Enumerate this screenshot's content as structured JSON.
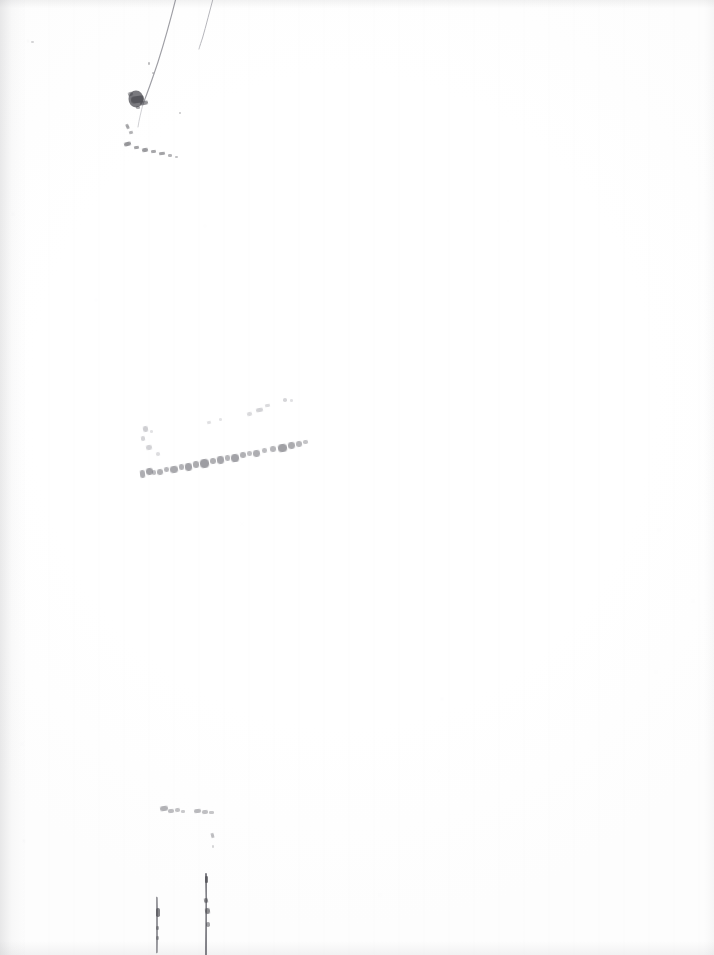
{
  "document": {
    "kind": "scanned-page",
    "page_label": "",
    "legible_text": "",
    "condition_note": "",
    "width_px": 714,
    "height_px": 955
  },
  "colors": {
    "paper": "#ffffff",
    "paper_tint": "#fdfdfd",
    "gutter_shadow": "#78787d",
    "ink_dark": "#4a4a4f",
    "ink_mid": "#7c7c82",
    "ink_faint": "#aeaeb4",
    "ink_ghost": "#d2d2d7"
  },
  "marks": {
    "top_strokes": [
      {
        "name": "diagonal-stroke-long",
        "path": "M176.5,-4 C172,14 165,40 158,62 C152,80 147,94 143,104",
        "width": 1.15,
        "color": "#8e8e95",
        "opacity": 0.85
      },
      {
        "name": "diagonal-stroke-short",
        "path": "M213.5,-3 C210,10 206,26 202.5,38 C200.5,44 199.5,47 199,49",
        "width": 1.0,
        "color": "#a3a3aa",
        "opacity": 0.8
      },
      {
        "name": "diagonal-stroke-tail",
        "path": "M143,104 C141,112 139,120 138,127",
        "width": 0.9,
        "color": "#b4b4ba",
        "opacity": 0.7
      }
    ],
    "top_blot": {
      "name": "ink-blot",
      "cx": 136,
      "cy": 99,
      "rx": 7.5,
      "ry": 8.5,
      "color": "#56565c",
      "opacity": 0.78
    },
    "top_fragments": [
      {
        "x": 128,
        "y": 92,
        "w": 5,
        "h": 4,
        "rot": -18,
        "op": 0.55
      },
      {
        "x": 131,
        "y": 96,
        "w": 13,
        "h": 7,
        "rot": -8,
        "op": 0.72
      },
      {
        "x": 140,
        "y": 101,
        "w": 8,
        "h": 4,
        "rot": -12,
        "op": 0.6
      },
      {
        "x": 136,
        "y": 106,
        "w": 4,
        "h": 3,
        "rot": 0,
        "op": 0.45
      },
      {
        "x": 126,
        "y": 124,
        "w": 3,
        "h": 5,
        "rot": -24,
        "op": 0.5
      },
      {
        "x": 129,
        "y": 131,
        "w": 4,
        "h": 3,
        "rot": -10,
        "op": 0.42
      },
      {
        "x": 124,
        "y": 142,
        "w": 7,
        "h": 4,
        "rot": -14,
        "op": 0.58
      },
      {
        "x": 134,
        "y": 146,
        "w": 5,
        "h": 3,
        "rot": -6,
        "op": 0.5
      },
      {
        "x": 142,
        "y": 148,
        "w": 6,
        "h": 4,
        "rot": -8,
        "op": 0.55
      },
      {
        "x": 151,
        "y": 150,
        "w": 5,
        "h": 3,
        "rot": -4,
        "op": 0.48
      },
      {
        "x": 159,
        "y": 152,
        "w": 6,
        "h": 3,
        "rot": -6,
        "op": 0.5
      },
      {
        "x": 168,
        "y": 154,
        "w": 4,
        "h": 3,
        "rot": 0,
        "op": 0.4
      },
      {
        "x": 175,
        "y": 156,
        "w": 3,
        "h": 2,
        "rot": 0,
        "op": 0.33
      },
      {
        "x": 179,
        "y": 112,
        "w": 2,
        "h": 2,
        "rot": 0,
        "op": 0.3
      },
      {
        "x": 148,
        "y": 62,
        "w": 2,
        "h": 3,
        "rot": 0,
        "op": 0.35
      },
      {
        "x": 152,
        "y": 72,
        "w": 2,
        "h": 2,
        "rot": 0,
        "op": 0.3
      },
      {
        "x": 31,
        "y": 41,
        "w": 3,
        "h": 2,
        "rot": 0,
        "op": 0.22
      }
    ],
    "mid_band": {
      "name": "faded-handwriting-line",
      "baseline_from": {
        "x": 138,
        "y": 474
      },
      "baseline_to": {
        "x": 312,
        "y": 449
      },
      "fragments": [
        {
          "x": 140,
          "y": 470,
          "w": 5,
          "h": 8,
          "rot": -6,
          "op": 0.62
        },
        {
          "x": 146,
          "y": 468,
          "w": 7,
          "h": 7,
          "rot": -8,
          "op": 0.7
        },
        {
          "x": 152,
          "y": 470,
          "w": 4,
          "h": 5,
          "rot": -5,
          "op": 0.5
        },
        {
          "x": 157,
          "y": 469,
          "w": 6,
          "h": 6,
          "rot": -7,
          "op": 0.6
        },
        {
          "x": 164,
          "y": 467,
          "w": 5,
          "h": 5,
          "rot": -6,
          "op": 0.55
        },
        {
          "x": 170,
          "y": 466,
          "w": 8,
          "h": 7,
          "rot": -8,
          "op": 0.66
        },
        {
          "x": 179,
          "y": 464,
          "w": 5,
          "h": 6,
          "rot": -6,
          "op": 0.58
        },
        {
          "x": 185,
          "y": 463,
          "w": 7,
          "h": 8,
          "rot": -7,
          "op": 0.7
        },
        {
          "x": 193,
          "y": 461,
          "w": 6,
          "h": 7,
          "rot": -6,
          "op": 0.64
        },
        {
          "x": 200,
          "y": 459,
          "w": 9,
          "h": 9,
          "rot": -8,
          "op": 0.74
        },
        {
          "x": 210,
          "y": 458,
          "w": 6,
          "h": 6,
          "rot": -5,
          "op": 0.6
        },
        {
          "x": 217,
          "y": 456,
          "w": 7,
          "h": 8,
          "rot": -7,
          "op": 0.68
        },
        {
          "x": 225,
          "y": 455,
          "w": 5,
          "h": 6,
          "rot": -5,
          "op": 0.56
        },
        {
          "x": 231,
          "y": 454,
          "w": 8,
          "h": 8,
          "rot": -7,
          "op": 0.7
        },
        {
          "x": 240,
          "y": 452,
          "w": 6,
          "h": 6,
          "rot": -6,
          "op": 0.6
        },
        {
          "x": 247,
          "y": 451,
          "w": 5,
          "h": 5,
          "rot": -4,
          "op": 0.5
        },
        {
          "x": 253,
          "y": 450,
          "w": 7,
          "h": 7,
          "rot": -6,
          "op": 0.62
        },
        {
          "x": 262,
          "y": 448,
          "w": 5,
          "h": 5,
          "rot": -5,
          "op": 0.5
        },
        {
          "x": 270,
          "y": 446,
          "w": 6,
          "h": 6,
          "rot": -6,
          "op": 0.55
        },
        {
          "x": 278,
          "y": 444,
          "w": 9,
          "h": 8,
          "rot": -8,
          "op": 0.72
        },
        {
          "x": 288,
          "y": 442,
          "w": 7,
          "h": 7,
          "rot": -7,
          "op": 0.64
        },
        {
          "x": 296,
          "y": 441,
          "w": 6,
          "h": 6,
          "rot": -5,
          "op": 0.55
        },
        {
          "x": 303,
          "y": 440,
          "w": 5,
          "h": 4,
          "rot": -4,
          "op": 0.45
        }
      ],
      "upper_fragments": [
        {
          "x": 143,
          "y": 426,
          "w": 5,
          "h": 6,
          "rot": -8,
          "op": 0.6
        },
        {
          "x": 141,
          "y": 436,
          "w": 4,
          "h": 5,
          "rot": -6,
          "op": 0.52
        },
        {
          "x": 146,
          "y": 445,
          "w": 6,
          "h": 5,
          "rot": -8,
          "op": 0.55
        },
        {
          "x": 150,
          "y": 430,
          "w": 3,
          "h": 3,
          "rot": 0,
          "op": 0.35
        },
        {
          "x": 156,
          "y": 452,
          "w": 4,
          "h": 4,
          "rot": -5,
          "op": 0.42
        },
        {
          "x": 207,
          "y": 421,
          "w": 4,
          "h": 3,
          "rot": -10,
          "op": 0.38
        },
        {
          "x": 219,
          "y": 418,
          "w": 3,
          "h": 3,
          "rot": 0,
          "op": 0.33
        },
        {
          "x": 247,
          "y": 412,
          "w": 5,
          "h": 4,
          "rot": -12,
          "op": 0.46
        },
        {
          "x": 256,
          "y": 408,
          "w": 7,
          "h": 4,
          "rot": -10,
          "op": 0.55
        },
        {
          "x": 265,
          "y": 404,
          "w": 5,
          "h": 3,
          "rot": -8,
          "op": 0.45
        },
        {
          "x": 283,
          "y": 398,
          "w": 4,
          "h": 4,
          "rot": 0,
          "op": 0.5
        },
        {
          "x": 290,
          "y": 399,
          "w": 3,
          "h": 3,
          "rot": 0,
          "op": 0.36
        }
      ]
    },
    "lower_fragments": [
      {
        "x": 160,
        "y": 806,
        "w": 8,
        "h": 5,
        "rot": -8,
        "op": 0.58
      },
      {
        "x": 168,
        "y": 809,
        "w": 6,
        "h": 4,
        "rot": -4,
        "op": 0.5
      },
      {
        "x": 175,
        "y": 808,
        "w": 5,
        "h": 4,
        "rot": -6,
        "op": 0.46
      },
      {
        "x": 181,
        "y": 810,
        "w": 4,
        "h": 3,
        "rot": 0,
        "op": 0.4
      },
      {
        "x": 194,
        "y": 809,
        "w": 7,
        "h": 4,
        "rot": -6,
        "op": 0.52
      },
      {
        "x": 202,
        "y": 810,
        "w": 6,
        "h": 4,
        "rot": -4,
        "op": 0.48
      },
      {
        "x": 209,
        "y": 811,
        "w": 5,
        "h": 3,
        "rot": 0,
        "op": 0.42
      },
      {
        "x": 211,
        "y": 833,
        "w": 3,
        "h": 5,
        "rot": -14,
        "op": 0.5
      },
      {
        "x": 212,
        "y": 845,
        "w": 2,
        "h": 3,
        "rot": 0,
        "op": 0.3
      }
    ],
    "bottom_strokes": [
      {
        "name": "vertical-stroke-left",
        "path": "M156.5,898 C156.8,910 157,922 156.8,934 C156.7,941 156.6,946 156.5,952",
        "width": 2.6,
        "color": "#6e6e75",
        "opacity": 0.7
      },
      {
        "name": "vertical-stroke-right",
        "path": "M206,874 C206.4,888 206.6,904 206.3,920 C206.1,934 206,944 206,955",
        "width": 2.0,
        "color": "#5e5e66",
        "opacity": 0.78
      }
    ],
    "bottom_fragments": [
      {
        "x": 205,
        "y": 876,
        "w": 3,
        "h": 7,
        "rot": 0,
        "op": 0.7
      },
      {
        "x": 204,
        "y": 898,
        "w": 4,
        "h": 5,
        "rot": -8,
        "op": 0.6
      },
      {
        "x": 205,
        "y": 908,
        "w": 5,
        "h": 6,
        "rot": -6,
        "op": 0.62
      },
      {
        "x": 206,
        "y": 922,
        "w": 4,
        "h": 5,
        "rot": 0,
        "op": 0.5
      },
      {
        "x": 156,
        "y": 908,
        "w": 4,
        "h": 9,
        "rot": 0,
        "op": 0.66
      },
      {
        "x": 156,
        "y": 926,
        "w": 3,
        "h": 4,
        "rot": 0,
        "op": 0.45
      },
      {
        "x": 156,
        "y": 936,
        "w": 3,
        "h": 4,
        "rot": 0,
        "op": 0.4
      }
    ],
    "speck_dots": [
      {
        "x": 28,
        "y": 41,
        "r": 1.2,
        "op": 0.18
      },
      {
        "x": 13,
        "y": 214,
        "r": 1.0,
        "op": 0.14
      },
      {
        "x": 205,
        "y": 226,
        "r": 0.9,
        "op": 0.12
      },
      {
        "x": 508,
        "y": 221,
        "r": 1.0,
        "op": 0.13
      },
      {
        "x": 442,
        "y": 699,
        "r": 1.1,
        "op": 0.15
      },
      {
        "x": 22,
        "y": 744,
        "r": 1.0,
        "op": 0.14
      },
      {
        "x": 24,
        "y": 841,
        "r": 1.2,
        "op": 0.16
      },
      {
        "x": 659,
        "y": 530,
        "r": 0.9,
        "op": 0.1
      },
      {
        "x": 693,
        "y": 601,
        "r": 0.9,
        "op": 0.1
      },
      {
        "x": 656,
        "y": 672,
        "r": 0.9,
        "op": 0.1
      },
      {
        "x": 242,
        "y": 524,
        "r": 0.9,
        "op": 0.11
      },
      {
        "x": 439,
        "y": 771,
        "r": 0.9,
        "op": 0.11
      },
      {
        "x": 380,
        "y": 895,
        "r": 0.9,
        "op": 0.1
      },
      {
        "x": 96,
        "y": 300,
        "r": 0.8,
        "op": 0.1
      }
    ]
  }
}
